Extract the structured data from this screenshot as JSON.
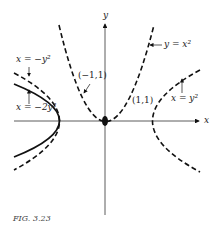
{
  "figure": {
    "caption": "FIG. 3.23",
    "axes": {
      "x_label": "x",
      "y_label": "y"
    },
    "curves": [
      {
        "label": "y = x²",
        "style": "dashed"
      },
      {
        "label": "x = y²",
        "style": "dashed"
      },
      {
        "label": "x = −y²",
        "style": "dashed"
      },
      {
        "label": "x = −2y²",
        "style": "solid"
      }
    ],
    "points": [
      {
        "label": "(−1,1)"
      },
      {
        "label": "(1,1)"
      }
    ],
    "colors": {
      "ink": "#111111",
      "background": "#ffffff"
    }
  }
}
